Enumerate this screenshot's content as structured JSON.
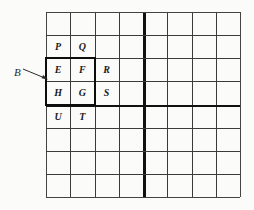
{
  "figure": {
    "background_color": "#fbfbfa",
    "line_color": "#3b3b3b",
    "thick_line_color": "#111111",
    "text_color": "#1a1a1a"
  },
  "grid": {
    "columns": 8,
    "rows": 8,
    "thick_divider_after_column": 4,
    "thick_divider_after_row": 4,
    "cell_width_px": 24.25,
    "cell_height_px": 23.125
  },
  "cells": [
    {
      "label": "P",
      "row": 2,
      "col": 1
    },
    {
      "label": "Q",
      "row": 2,
      "col": 2
    },
    {
      "label": "E",
      "row": 3,
      "col": 1
    },
    {
      "label": "F",
      "row": 3,
      "col": 2
    },
    {
      "label": "R",
      "row": 3,
      "col": 3
    },
    {
      "label": "H",
      "row": 4,
      "col": 1
    },
    {
      "label": "G",
      "row": 4,
      "col": 2
    },
    {
      "label": "S",
      "row": 4,
      "col": 3
    },
    {
      "label": "U",
      "row": 5,
      "col": 1
    },
    {
      "label": "T",
      "row": 5,
      "col": 2
    }
  ],
  "bold_box": {
    "name": "B",
    "start_row": 3,
    "start_col": 1,
    "row_span": 2,
    "col_span": 2,
    "encloses": [
      "E",
      "F",
      "H",
      "G"
    ]
  },
  "callout": {
    "label": "B",
    "points_to": "bold-box"
  }
}
